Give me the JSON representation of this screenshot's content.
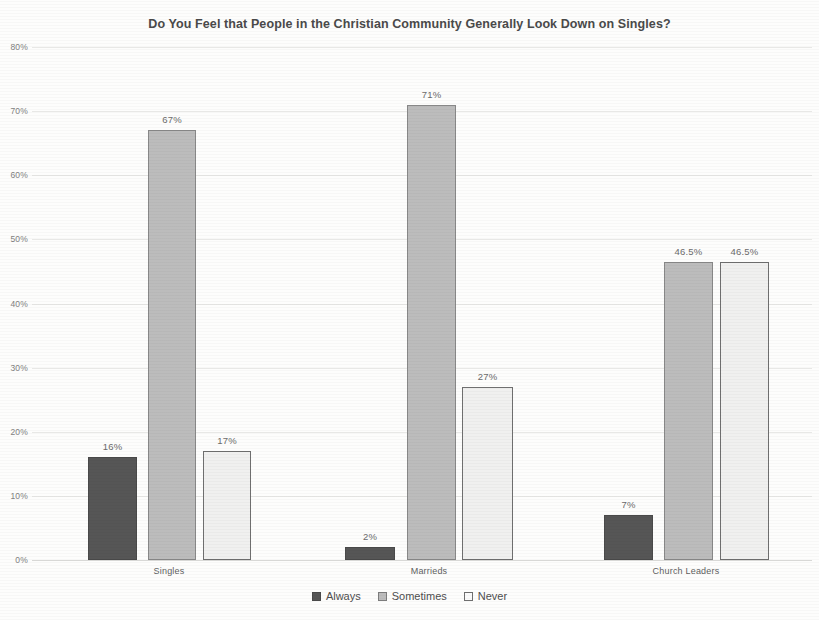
{
  "chart_data": {
    "type": "bar",
    "title": "Do You Feel that People in the Christian Community Generally Look Down on Singles?",
    "xlabel": "",
    "ylabel": "",
    "ylim": [
      0,
      80
    ],
    "ytick_labels": [
      "0%",
      "10%",
      "20%",
      "30%",
      "40%",
      "50%",
      "60%",
      "70%",
      "80%"
    ],
    "ytick_values": [
      0,
      10,
      20,
      30,
      40,
      50,
      60,
      70,
      80
    ],
    "categories": [
      "Singles",
      "Marrieds",
      "Church Leaders"
    ],
    "grid": true,
    "legend_position": "bottom",
    "series": [
      {
        "name": "Always",
        "key": "always",
        "color": "#565656",
        "values": [
          16,
          2,
          7
        ],
        "labels": [
          "16%",
          "2%",
          "7%"
        ]
      },
      {
        "name": "Sometimes",
        "key": "sometimes",
        "color": "#bcbcbc",
        "values": [
          67,
          71,
          46.5
        ],
        "labels": [
          "67%",
          "71%",
          "46.5%"
        ]
      },
      {
        "name": "Never",
        "key": "never",
        "color": "#f0f0ef",
        "values": [
          17,
          27,
          46.5
        ],
        "labels": [
          "17%",
          "27%",
          "46.5%"
        ]
      }
    ]
  }
}
